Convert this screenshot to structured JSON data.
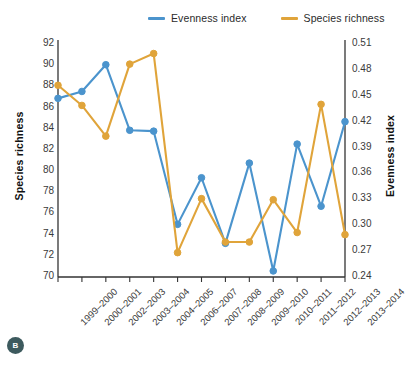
{
  "chart_data": {
    "type": "line",
    "title": "",
    "categories": [
      "1999–2000",
      "2000–2001",
      "2002–2003",
      "2003–2004",
      "2004–2005",
      "2006–2007",
      "2007–2008",
      "2008–2009",
      "2009–2010",
      "2010–2011",
      "2011–2012",
      "2012–2013",
      "2013–2014"
    ],
    "series": [
      {
        "name": "Evenness index",
        "axis": "right",
        "color": "#4b94cd",
        "values": [
          0.447,
          0.455,
          0.486,
          0.41,
          0.409,
          0.301,
          0.355,
          0.279,
          0.372,
          0.247,
          0.394,
          0.322,
          0.42
        ]
      },
      {
        "name": "Species richness",
        "axis": "left",
        "color": "#e0a43a",
        "values": [
          88.1,
          86.2,
          83.3,
          90.1,
          91.1,
          72.3,
          77.4,
          73.3,
          73.3,
          77.3,
          74.2,
          86.3,
          74.0
        ]
      }
    ],
    "xlabel": "",
    "ylabel_left": "Species richness",
    "ylabel_right": "Evenness index",
    "ylim_left": [
      70,
      92
    ],
    "ylim_right": [
      0.24,
      0.51
    ],
    "yticks_left": [
      "92",
      "90",
      "88",
      "86",
      "84",
      "82",
      "80",
      "78",
      "76",
      "74",
      "72",
      "70"
    ],
    "yticks_right": [
      "0.51",
      "0.48",
      "0.45",
      "0.42",
      "0.39",
      "0.36",
      "0.33",
      "0.30",
      "0.27",
      "0.24"
    ],
    "grid": false,
    "legend_position": "top"
  },
  "legend": {
    "items": [
      {
        "label": "Evenness index",
        "color": "#4b94cd"
      },
      {
        "label": "Species richness",
        "color": "#e0a43a"
      }
    ]
  },
  "badge": {
    "label": "B"
  }
}
